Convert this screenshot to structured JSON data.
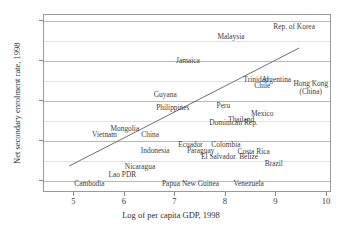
{
  "chart_data": {
    "type": "scatter",
    "title": "",
    "xlabel": "Log of per capita GDP, 1998",
    "ylabel": "Net secondary enrolment rate, 1998",
    "xlim": [
      4.4,
      10.1
    ],
    "ylim": [
      14,
      103
    ],
    "xticks": [
      "5",
      "6",
      "7",
      "8",
      "9",
      "10"
    ],
    "xtick_values": [
      5,
      6,
      7,
      8,
      9,
      10
    ],
    "yticks": [
      "20",
      "40",
      "60",
      "80",
      "100"
    ],
    "ytick_values": [
      20,
      40,
      60,
      80,
      100
    ],
    "gridlines_y": [
      20,
      30,
      40,
      50,
      60,
      70,
      80,
      90,
      100
    ],
    "grid": true,
    "legend": "none",
    "labels_as_markers": true,
    "trendline": {
      "x0": 4.9,
      "y0": 27.5,
      "x1": 9.45,
      "y1": 86.5
    },
    "points": [
      {
        "label": "Rep. of Korea",
        "x": 9.35,
        "y": 97.0
      },
      {
        "label": "Malaysia",
        "x": 8.1,
        "y": 92.0
      },
      {
        "label": "Jamaica",
        "x": 7.25,
        "y": 80.0
      },
      {
        "label": "Trinidad",
        "x": 8.6,
        "y": 70.5
      },
      {
        "label": "Argentina",
        "x": 9.0,
        "y": 70.5
      },
      {
        "label": "Chile",
        "x": 8.72,
        "y": 67.5
      },
      {
        "label": "Hong Kong (China)",
        "x": 9.68,
        "y": 66.5
      },
      {
        "label": "Guyana",
        "x": 6.8,
        "y": 63.0
      },
      {
        "label": "Philippines",
        "x": 6.95,
        "y": 56.5
      },
      {
        "label": "Peru",
        "x": 7.95,
        "y": 57.5
      },
      {
        "label": "Mexico",
        "x": 8.72,
        "y": 53.5
      },
      {
        "label": "Thailand",
        "x": 8.3,
        "y": 50.5
      },
      {
        "label": "Dominican Rep.",
        "x": 8.15,
        "y": 49.0
      },
      {
        "label": "Mongolia",
        "x": 6.0,
        "y": 46.0
      },
      {
        "label": "Vietnam",
        "x": 5.6,
        "y": 43.0
      },
      {
        "label": "China",
        "x": 6.5,
        "y": 43.0
      },
      {
        "label": "Ecuador",
        "x": 7.3,
        "y": 38.0
      },
      {
        "label": "Colombia",
        "x": 8.0,
        "y": 38.0
      },
      {
        "label": "Indonesia",
        "x": 6.6,
        "y": 35.0
      },
      {
        "label": "Paraguay",
        "x": 7.5,
        "y": 35.0
      },
      {
        "label": "Costa Rica",
        "x": 8.55,
        "y": 34.5
      },
      {
        "label": "El Salvador",
        "x": 7.85,
        "y": 32.0
      },
      {
        "label": "Belize",
        "x": 8.45,
        "y": 32.0
      },
      {
        "label": "Brazil",
        "x": 8.95,
        "y": 28.5
      },
      {
        "label": "Nicaragua",
        "x": 6.3,
        "y": 27.0
      },
      {
        "label": "Lao PDR",
        "x": 5.95,
        "y": 23.0
      },
      {
        "label": "Cambodia",
        "x": 5.3,
        "y": 18.5
      },
      {
        "label": "Papua New Guinea",
        "x": 7.3,
        "y": 18.5
      },
      {
        "label": "Venezuela",
        "x": 8.45,
        "y": 18.5
      }
    ]
  }
}
